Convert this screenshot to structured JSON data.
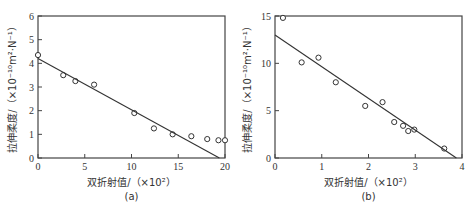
{
  "chart_data": [
    {
      "id": "a",
      "type": "scatter",
      "caption": "(a)",
      "xlabel": "双折射值/（×10²）",
      "ylabel": "拉伸柔度/（×10⁻¹⁰m²·N⁻¹）",
      "xlim": [
        0,
        20
      ],
      "ylim": [
        0,
        6
      ],
      "xticks": [
        "0",
        "5",
        "10",
        "15",
        "20"
      ],
      "yticks": [
        "0",
        "1",
        "2",
        "3",
        "4",
        "5",
        "6"
      ],
      "grid": false,
      "series": [
        {
          "name": "measured",
          "marker": "open-circle",
          "x": [
            0,
            2.7,
            4.0,
            6.0,
            10.3,
            12.4,
            14.4,
            16.4,
            18.1,
            19.3,
            20.0
          ],
          "y": [
            4.35,
            3.5,
            3.25,
            3.1,
            1.9,
            1.25,
            1.0,
            0.92,
            0.8,
            0.75,
            0.75
          ]
        },
        {
          "name": "fit",
          "type": "line",
          "x": [
            0,
            19.4
          ],
          "y": [
            4.2,
            0
          ]
        }
      ]
    },
    {
      "id": "b",
      "type": "scatter",
      "caption": "(b)",
      "xlabel": "双折射值/（×10²）",
      "ylabel": "拉伸柔度/（×10⁻¹⁰m²·N⁻¹）",
      "xlim": [
        0,
        4
      ],
      "ylim": [
        0,
        15
      ],
      "xticks": [
        "0",
        "1",
        "2",
        "3",
        "4"
      ],
      "yticks": [
        "0",
        "5",
        "10",
        "15"
      ],
      "grid": false,
      "series": [
        {
          "name": "measured",
          "marker": "open-circle",
          "x": [
            0.17,
            0.57,
            0.93,
            1.3,
            1.93,
            2.3,
            2.55,
            2.74,
            2.85,
            2.98,
            3.62
          ],
          "y": [
            14.8,
            10.1,
            10.6,
            8.0,
            5.5,
            5.9,
            3.8,
            3.4,
            2.85,
            3.0,
            1.0
          ]
        },
        {
          "name": "fit",
          "type": "line",
          "x": [
            0,
            3.88
          ],
          "y": [
            13.0,
            0
          ]
        }
      ]
    }
  ]
}
